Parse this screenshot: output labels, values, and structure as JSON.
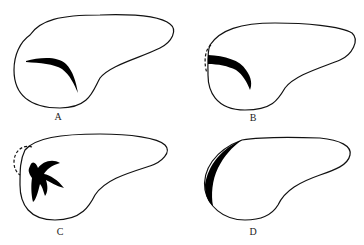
{
  "diagram": {
    "panels": [
      {
        "id": "A",
        "label": "A"
      },
      {
        "id": "B",
        "label": "B"
      },
      {
        "id": "C",
        "label": "C"
      },
      {
        "id": "D",
        "label": "D"
      }
    ],
    "colors": {
      "outline": "#111111",
      "fill": "#000000",
      "background": "#ffffff"
    }
  }
}
